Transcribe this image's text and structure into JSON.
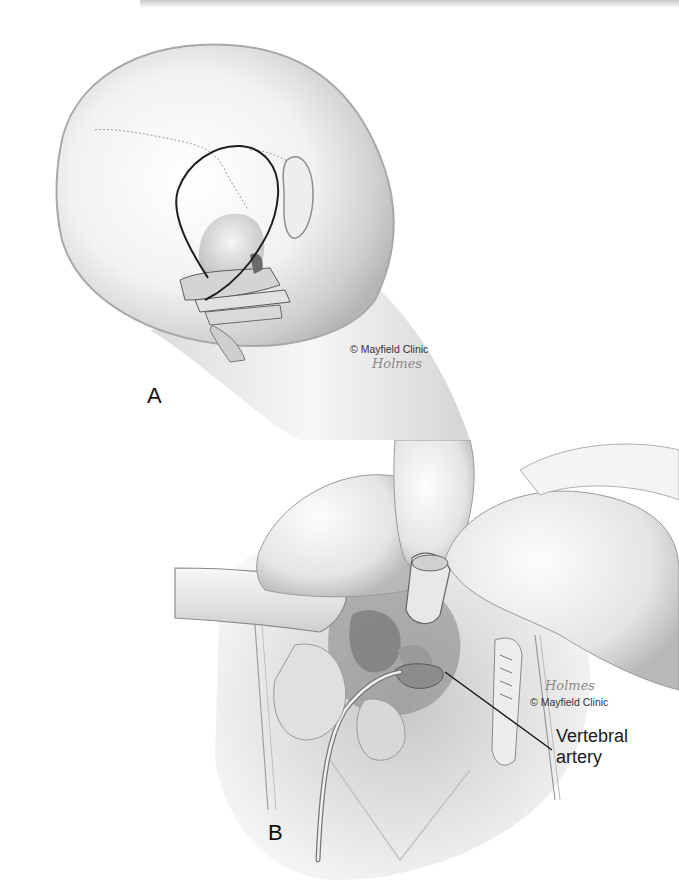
{
  "figure": {
    "panels": [
      {
        "id": "A",
        "label": "A",
        "credit": "© Mayfield Clinic",
        "signature": "Holmes",
        "subject": "posterior view of head with incision outline over craniocervical junction"
      },
      {
        "id": "B",
        "label": "B",
        "credit": "© Mayfield Clinic",
        "signature": "Holmes",
        "subject": "surgical exposure with retractors and instrument",
        "callouts": [
          {
            "text_line1": "Vertebral",
            "text_line2": "artery"
          }
        ]
      }
    ]
  },
  "colors": {
    "background": "#ffffff",
    "ink": "#1a1a1a",
    "shade_light": "#e6e6e6",
    "shade_mid": "#bdbdbd",
    "shade_dark": "#6e6e6e"
  }
}
